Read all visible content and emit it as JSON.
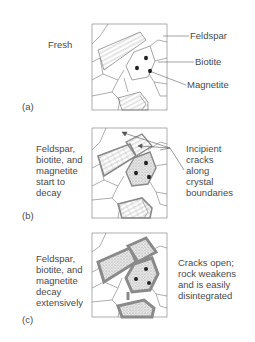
{
  "figure": {
    "panels": [
      {
        "id": "a",
        "letter": "(a)",
        "left_caption": "Fresh",
        "callouts": [
          "Feldspar",
          "Biotite",
          "Magnetite"
        ]
      },
      {
        "id": "b",
        "letter": "(b)",
        "left_caption": "Feldspar,\nbiotite, and\nmagnetite\nstart to\ndecay",
        "right_caption": "Incipient\ncracks\nalong\ncrystal\nboundaries"
      },
      {
        "id": "c",
        "letter": "(c)",
        "left_caption": "Feldspar,\nbiotite, and\nmagnetite\ndecay\nextensively",
        "right_caption": "Cracks open;\nrock weakens\nand is easily\ndisintegrated"
      }
    ],
    "colors": {
      "line": "#777777",
      "decay_border": "#8a8a8a",
      "dot": "#222222",
      "text": "#4a4a4a"
    }
  }
}
